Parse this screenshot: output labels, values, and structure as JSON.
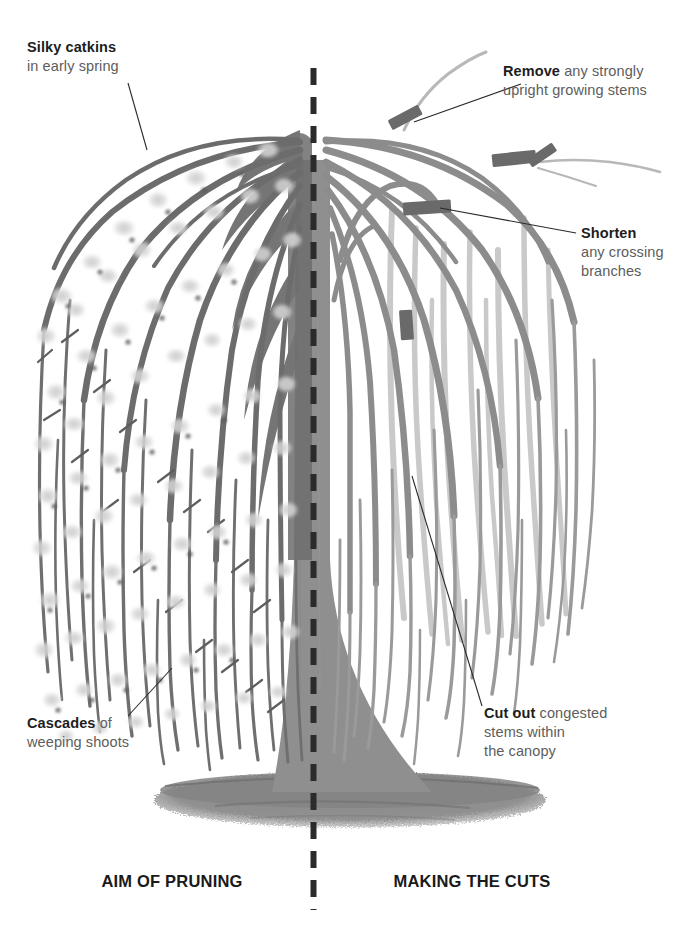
{
  "diagram": {
    "divider": {
      "style": "dashed-vertical",
      "color": "#2b2b2b",
      "x": 313
    },
    "palette": {
      "branch_dark": "#6e6e6e",
      "branch_mid": "#8e8e8e",
      "branch_light": "#c9c9c9",
      "trunk": "#8f8f8f",
      "catkin": "#d9d9d9",
      "catkin_core": "#5a5a5a",
      "ground": "#8c8c8c",
      "cut_mark": "#6a6a6a",
      "leader_line": "#2a2a2a",
      "text_bold": "#1d1d1d",
      "text_body": "#5d5d5d",
      "background": "#ffffff"
    }
  },
  "callouts": [
    {
      "id": "silky-catkins",
      "lead": "Silky catkins",
      "lines": [
        "in early spring"
      ],
      "side": "left"
    },
    {
      "id": "cascades",
      "lead": "Cascades",
      "lines": [
        "of",
        "weeping shoots"
      ],
      "side": "left"
    },
    {
      "id": "remove-upright",
      "lead": "Remove",
      "lines": [
        "any strongly",
        "upright growing stems"
      ],
      "side": "right"
    },
    {
      "id": "shorten-crossing",
      "lead": "Shorten",
      "lines": [
        "any crossing",
        "branches"
      ],
      "side": "right"
    },
    {
      "id": "cut-out-congested",
      "lead": "Cut out",
      "lines": [
        "congested",
        "stems within",
        "the canopy"
      ],
      "side": "right"
    }
  ],
  "text": {
    "silky_lead": "Silky catkins",
    "silky_l1": "in early spring",
    "cascades_lead": "Cascades",
    "cascades_of": " of",
    "cascades_l2": "weeping shoots",
    "remove_lead": "Remove",
    "remove_rest": " any strongly",
    "remove_l2": "upright growing stems",
    "shorten_lead": "Shorten",
    "shorten_l2": "any crossing",
    "shorten_l3": "branches",
    "cutout_lead": "Cut out",
    "cutout_rest": " congested",
    "cutout_l2": "stems within",
    "cutout_l3": "the canopy"
  },
  "captions": {
    "left": "AIM OF PRUNING",
    "right": "MAKING THE CUTS"
  }
}
